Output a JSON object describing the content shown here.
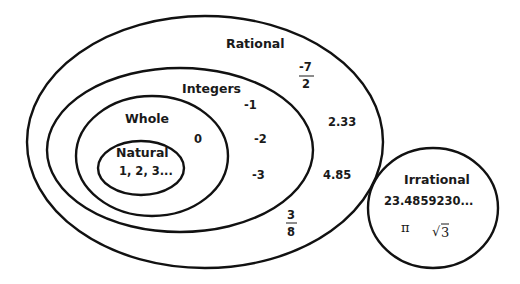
{
  "sets": {
    "rational": {
      "label": "Rational",
      "examples": {
        "frac1": {
          "numerator": "-7",
          "denominator": "2"
        },
        "decimal1": "2.33",
        "decimal2": "4.85",
        "frac2": {
          "numerator": "3",
          "denominator": "8"
        }
      }
    },
    "integers": {
      "label": "Integers",
      "examples": [
        "-1",
        "-2",
        "-3"
      ]
    },
    "whole": {
      "label": "Whole",
      "examples": [
        "0"
      ]
    },
    "natural": {
      "label": "Natural",
      "examples": "1, 2, 3..."
    },
    "irrational": {
      "label": "Irrational",
      "examples": {
        "decimal": "23.4859230...",
        "pi": "π",
        "sqrt_symbol": "√",
        "sqrt_value": "3"
      }
    }
  },
  "colors": {
    "stroke": "#111111",
    "text": "#1a1a1a",
    "background": "#ffffff"
  }
}
